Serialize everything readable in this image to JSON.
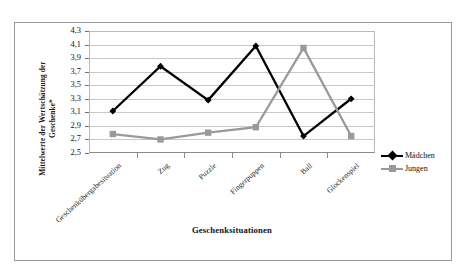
{
  "chart_data": {
    "type": "line",
    "title": "",
    "xlabel": "Geschenksituationen",
    "ylabel": "Mittelwerte der Wertschätzung der Geschenke*",
    "ylabel_line1": "Mittelwerte der Wertschätzung der",
    "ylabel_line2": "Geschenke*",
    "categories": [
      "Geschenkübergabesituation",
      "Zug",
      "Puzzle",
      "Fingerpuppen",
      "Ball",
      "Glockenspiel"
    ],
    "series": [
      {
        "name": "Mädchen",
        "color": "#000000",
        "marker": "diamond",
        "values": [
          3.12,
          3.78,
          3.28,
          4.08,
          2.75,
          3.3
        ]
      },
      {
        "name": "Jungen",
        "color": "#9a9a9a",
        "marker": "square",
        "values": [
          2.78,
          2.7,
          2.8,
          2.88,
          4.05,
          2.75
        ]
      }
    ],
    "ylim": [
      2.5,
      4.3
    ],
    "ytick_labels": [
      "4,3",
      "4,1",
      "3,9",
      "3,7",
      "3,5",
      "3,3",
      "3,1",
      "2,9",
      "2,7",
      "2,5"
    ],
    "ytick_values": [
      4.3,
      4.1,
      3.9,
      3.7,
      3.5,
      3.3,
      3.1,
      2.9,
      2.7,
      2.5
    ],
    "grid": true,
    "legend_position": "right"
  },
  "legend": {
    "items": [
      {
        "label": "Mädchen"
      },
      {
        "label": "Jungen"
      }
    ]
  }
}
